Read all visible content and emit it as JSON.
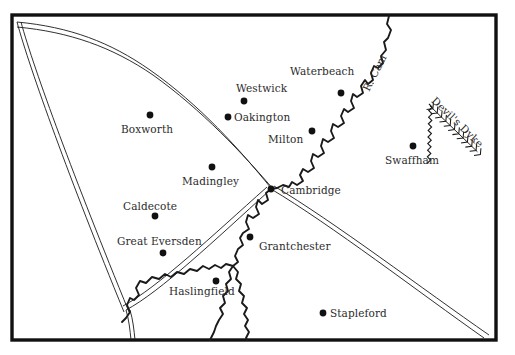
{
  "map": {
    "title": "Cambridge area map",
    "frame": {
      "x": 12,
      "y": 15,
      "width": 484,
      "height": 325,
      "stroke": "#111111",
      "stroke_width": 3.2
    },
    "background_color": "#ffffff",
    "ink_color": "#2b2b2b",
    "settlements": [
      {
        "name": "Boxworth",
        "dot_x": 150,
        "dot_y": 115,
        "label_x": 121,
        "label_y": 124,
        "label_anchor": "below"
      },
      {
        "name": "Westwick",
        "dot_x": 244,
        "dot_y": 101,
        "label_x": 236,
        "label_y": 83,
        "label_anchor": "above"
      },
      {
        "name": "Waterbeach",
        "dot_x": 341,
        "dot_y": 93,
        "label_x": 290,
        "label_y": 66,
        "label_anchor": "above"
      },
      {
        "name": "Oakington",
        "dot_x": 228,
        "dot_y": 117,
        "label_x": 234,
        "label_y": 112,
        "label_anchor": "right"
      },
      {
        "name": "Milton",
        "dot_x": 312,
        "dot_y": 131,
        "label_x": 268,
        "label_y": 134,
        "label_anchor": "left"
      },
      {
        "name": "Swaffham",
        "dot_x": 413,
        "dot_y": 146,
        "label_x": 385,
        "label_y": 155,
        "label_anchor": "below"
      },
      {
        "name": "Madingley",
        "dot_x": 212,
        "dot_y": 167,
        "label_x": 182,
        "label_y": 176,
        "label_anchor": "below"
      },
      {
        "name": "Cambridge",
        "dot_x": 271,
        "dot_y": 189,
        "label_x": 281,
        "label_y": 185,
        "label_anchor": "right"
      },
      {
        "name": "Caldecote",
        "dot_x": 155,
        "dot_y": 216,
        "label_x": 123,
        "label_y": 201,
        "label_anchor": "above"
      },
      {
        "name": "Great Eversden",
        "dot_x": 163,
        "dot_y": 253,
        "label_x": 117,
        "label_y": 236,
        "label_anchor": "above"
      },
      {
        "name": "Grantchester",
        "dot_x": 250,
        "dot_y": 237,
        "label_x": 259,
        "label_y": 241,
        "label_anchor": "right"
      },
      {
        "name": "Haslingfield",
        "dot_x": 216,
        "dot_y": 281,
        "label_x": 169,
        "label_y": 286,
        "label_anchor": "below-left"
      },
      {
        "name": "Stapleford",
        "dot_x": 323,
        "dot_y": 313,
        "label_x": 330,
        "label_y": 308,
        "label_anchor": "right"
      }
    ],
    "features": [
      {
        "name": "R. Cam",
        "type": "river",
        "label_x": 361,
        "label_y": 88,
        "rotation_deg": -63
      },
      {
        "name": "Devil's Dyke",
        "type": "earthwork",
        "label_x": 437,
        "label_y": 95,
        "rotation_deg": 44
      }
    ],
    "road_count": 4,
    "dot_radius": 3.4
  }
}
